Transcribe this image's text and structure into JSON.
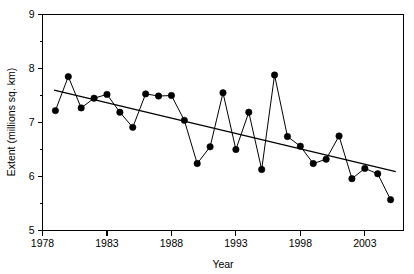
{
  "chart_data": {
    "type": "line",
    "title": "",
    "xlabel": "Year",
    "ylabel": "Extent (millions sq. km)",
    "xlim": [
      1978,
      2006
    ],
    "ylim": [
      5,
      9
    ],
    "grid": false,
    "legend": "none",
    "x_ticks": [
      1978,
      1983,
      1988,
      1993,
      1998,
      2003
    ],
    "x_minor_step": 1,
    "y_ticks": [
      5,
      6,
      7,
      8,
      9
    ],
    "y_minor_ticks": [
      5.5,
      6.5,
      7.5,
      8.5
    ],
    "markers": "filled-circle",
    "series": [
      {
        "name": "Extent",
        "x": [
          1979,
          1980,
          1981,
          1982,
          1983,
          1984,
          1985,
          1986,
          1987,
          1988,
          1989,
          1990,
          1991,
          1992,
          1993,
          1994,
          1995,
          1996,
          1997,
          1998,
          1999,
          2000,
          2001,
          2002,
          2003,
          2004,
          2005
        ],
        "values": [
          7.22,
          7.85,
          7.27,
          7.45,
          7.52,
          7.19,
          6.91,
          7.53,
          7.49,
          7.5,
          7.04,
          6.24,
          6.55,
          7.55,
          6.5,
          7.19,
          6.13,
          7.88,
          6.74,
          6.56,
          6.24,
          6.32,
          6.75,
          5.96,
          6.15,
          6.05,
          5.57
        ]
      }
    ],
    "trend": {
      "name": "linear trend",
      "x": [
        1978.9,
        2005.4
      ],
      "values": [
        7.6,
        6.09
      ]
    }
  },
  "axes": {
    "y_tick_labels": [
      "9",
      "8",
      "7",
      "6",
      "5"
    ],
    "x_tick_labels": [
      "1978",
      "1983",
      "1988",
      "1993",
      "1998",
      "2003"
    ],
    "y_title": "Extent (millions sq. km)",
    "x_title": "Year"
  }
}
